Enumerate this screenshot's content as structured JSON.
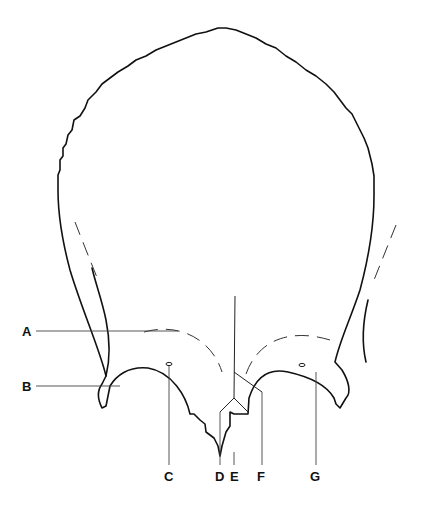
{
  "figure": {
    "labels": [
      {
        "id": "A",
        "text": "A"
      },
      {
        "id": "B",
        "text": "B"
      },
      {
        "id": "C",
        "text": "C"
      },
      {
        "id": "D",
        "text": "D"
      },
      {
        "id": "E",
        "text": "E"
      },
      {
        "id": "F",
        "text": "F"
      },
      {
        "id": "G",
        "text": "G"
      }
    ],
    "colors": {
      "line": "#111111",
      "background": "#ffffff"
    }
  }
}
